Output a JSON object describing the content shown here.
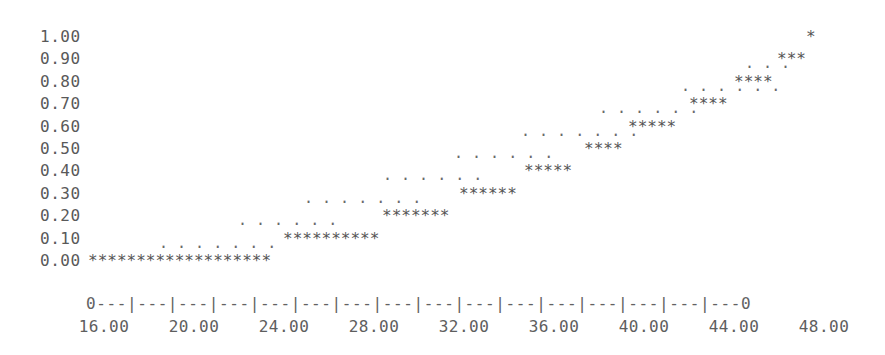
{
  "chart_data": {
    "type": "line",
    "title": "",
    "subtitle": "",
    "xlabel": "",
    "ylabel": "",
    "style": "ascii-character-plot",
    "xlim": [
      16.0,
      48.0
    ],
    "ylim": [
      0.0,
      1.0
    ],
    "grid": false,
    "legend": "none",
    "y_ticks": [
      "1.00",
      "0.90",
      "0.80",
      "0.70",
      "0.60",
      "0.50",
      "0.40",
      "0.30",
      "0.20",
      "0.10",
      "0.00"
    ],
    "y_tick_values": [
      1.0,
      0.9,
      0.8,
      0.7,
      0.6,
      0.5,
      0.4,
      0.3,
      0.2,
      0.1,
      0.0
    ],
    "x_ticks": [
      "16.00",
      "20.00",
      "24.00",
      "28.00",
      "32.00",
      "36.00",
      "40.00",
      "44.00",
      "48.00"
    ],
    "x_tick_values": [
      16.0,
      20.0,
      24.0,
      28.0,
      32.0,
      36.0,
      40.0,
      44.0,
      48.0
    ],
    "x_axis_string": "0---|---|---|---|---|---|---|---|---|---|---|---|---|---|---|---0",
    "series": [
      {
        "name": "dots",
        "marker": ".",
        "points": [
          {
            "y": 0.1,
            "x_start": 22.1,
            "x_end": 24.2,
            "count": 7
          },
          {
            "y": 0.2,
            "x_start": 24.9,
            "x_end": 27.1,
            "count": 6
          },
          {
            "y": 0.3,
            "x_start": 27.3,
            "x_end": 29.9,
            "count": 7
          },
          {
            "y": 0.4,
            "x_start": 30.2,
            "x_end": 32.4,
            "count": 6
          },
          {
            "y": 0.5,
            "x_start": 32.8,
            "x_end": 35.1,
            "count": 6
          },
          {
            "y": 0.6,
            "x_start": 35.2,
            "x_end": 37.9,
            "count": 7
          },
          {
            "y": 0.7,
            "x_start": 38.2,
            "x_end": 40.4,
            "count": 6
          },
          {
            "y": 0.8,
            "x_start": 41.1,
            "x_end": 43.0,
            "count": 6
          },
          {
            "y": 0.9,
            "x_start": 43.5,
            "x_end": 44.6,
            "count": 3
          }
        ]
      },
      {
        "name": "stars",
        "marker": "*",
        "points": [
          {
            "y": 0.0,
            "x_start": 16.0,
            "x_end": 23.0,
            "count": 19
          },
          {
            "y": 0.1,
            "x_start": 26.5,
            "x_end": 30.0,
            "count": 10
          },
          {
            "y": 0.2,
            "x_start": 30.2,
            "x_end": 33.2,
            "count": 7
          },
          {
            "y": 0.3,
            "x_start": 33.1,
            "x_end": 35.5,
            "count": 6
          },
          {
            "y": 0.4,
            "x_start": 35.6,
            "x_end": 37.6,
            "count": 5
          },
          {
            "y": 0.5,
            "x_start": 37.9,
            "x_end": 39.6,
            "count": 4
          },
          {
            "y": 0.6,
            "x_start": 39.8,
            "x_end": 41.8,
            "count": 5
          },
          {
            "y": 0.7,
            "x_start": 42.0,
            "x_end": 43.6,
            "count": 4
          },
          {
            "y": 0.8,
            "x_start": 43.8,
            "x_end": 45.5,
            "count": 4
          },
          {
            "y": 0.9,
            "x_start": 46.0,
            "x_end": 47.1,
            "count": 3
          },
          {
            "y": 1.0,
            "x_start": 47.6,
            "x_end": 47.6,
            "count": 1
          }
        ]
      }
    ]
  },
  "rows": [
    {
      "label": "1.00",
      "marks": [
        {
          "type": "star",
          "left": 806,
          "text": "*"
        }
      ]
    },
    {
      "label": "0.90",
      "marks": [
        {
          "type": "dot",
          "left": 745,
          "text": ". . ."
        },
        {
          "type": "star",
          "left": 777,
          "text": "***"
        }
      ]
    },
    {
      "label": "0.80",
      "marks": [
        {
          "type": "dot",
          "left": 681,
          "text": ". . . . . ."
        },
        {
          "type": "star",
          "left": 734,
          "text": "****"
        }
      ]
    },
    {
      "label": "0.70",
      "marks": [
        {
          "type": "dot",
          "left": 599,
          "text": ". . . . . ."
        },
        {
          "type": "star",
          "left": 689,
          "text": "****"
        }
      ]
    },
    {
      "label": "0.60",
      "marks": [
        {
          "type": "dot",
          "left": 521,
          "text": ". . . . . . ."
        },
        {
          "type": "star",
          "left": 628,
          "text": "*****"
        }
      ]
    },
    {
      "label": "0.50",
      "marks": [
        {
          "type": "dot",
          "left": 454,
          "text": ". . . . . ."
        },
        {
          "type": "star",
          "left": 584,
          "text": "****"
        }
      ]
    },
    {
      "label": "0.40",
      "marks": [
        {
          "type": "dot",
          "left": 383,
          "text": ". . . . . ."
        },
        {
          "type": "star",
          "left": 524,
          "text": "*****"
        }
      ]
    },
    {
      "label": "0.30",
      "marks": [
        {
          "type": "dot",
          "left": 304,
          "text": ". . . . . . ."
        },
        {
          "type": "star",
          "left": 459,
          "text": "******"
        }
      ]
    },
    {
      "label": "0.20",
      "marks": [
        {
          "type": "dot",
          "left": 238,
          "text": ". . . . . ."
        },
        {
          "type": "star",
          "left": 382,
          "text": "*******"
        }
      ]
    },
    {
      "label": "0.10",
      "marks": [
        {
          "type": "dot",
          "left": 159,
          "text": ". . . . . . ."
        },
        {
          "type": "star",
          "left": 283,
          "text": "**********"
        }
      ]
    },
    {
      "label": "0.00",
      "marks": [
        {
          "type": "star",
          "left": 88,
          "text": "*******************"
        }
      ]
    }
  ],
  "axis": {
    "line": "0---|---|---|---|---|---|---|---|---|---|---|---|---|---|---|---0",
    "labels": [
      {
        "text": "16.00",
        "center": 104
      },
      {
        "text": "20.00",
        "center": 194
      },
      {
        "text": "24.00",
        "center": 284
      },
      {
        "text": "28.00",
        "center": 374
      },
      {
        "text": "32.00",
        "center": 464
      },
      {
        "text": "36.00",
        "center": 554
      },
      {
        "text": "40.00",
        "center": 644
      },
      {
        "text": "44.00",
        "center": 734
      },
      {
        "text": "48.00",
        "center": 824
      }
    ]
  },
  "colors": {
    "background": "#ffffff",
    "text": "#5b5b5b",
    "mark": "#555555"
  }
}
